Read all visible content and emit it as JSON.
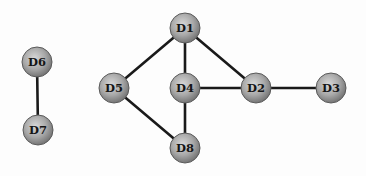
{
  "diagram": {
    "type": "undirected-graph",
    "node_radius": 15,
    "colors": {
      "edge": "#1a1a1a",
      "node_fill_light": "#cfcfcf",
      "node_fill_dark": "#7d7d7d",
      "label": "#151515",
      "background": "#fdfdfd"
    },
    "nodes": [
      {
        "id": "D1",
        "label": "D1",
        "x": 185,
        "y": 28
      },
      {
        "id": "D2",
        "label": "D2",
        "x": 256,
        "y": 88
      },
      {
        "id": "D3",
        "label": "D3",
        "x": 331,
        "y": 88
      },
      {
        "id": "D4",
        "label": "D4",
        "x": 185,
        "y": 88
      },
      {
        "id": "D5",
        "label": "D5",
        "x": 114,
        "y": 88
      },
      {
        "id": "D6",
        "label": "D6",
        "x": 37,
        "y": 62
      },
      {
        "id": "D7",
        "label": "D7",
        "x": 38,
        "y": 130
      },
      {
        "id": "D8",
        "label": "D8",
        "x": 185,
        "y": 148
      }
    ],
    "edges": [
      {
        "from": "D1",
        "to": "D5"
      },
      {
        "from": "D1",
        "to": "D4"
      },
      {
        "from": "D1",
        "to": "D2"
      },
      {
        "from": "D4",
        "to": "D2"
      },
      {
        "from": "D2",
        "to": "D3"
      },
      {
        "from": "D5",
        "to": "D8"
      },
      {
        "from": "D4",
        "to": "D8"
      },
      {
        "from": "D6",
        "to": "D7"
      }
    ]
  }
}
